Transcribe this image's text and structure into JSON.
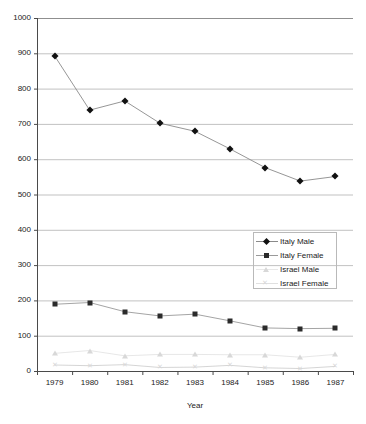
{
  "chart_data": {
    "type": "line",
    "title": "",
    "xlabel": "Year",
    "ylabel": "",
    "categories": [
      "1979",
      "1980",
      "1981",
      "1982",
      "1983",
      "1984",
      "1985",
      "1986",
      "1987"
    ],
    "x": [
      1979,
      1980,
      1981,
      1982,
      1983,
      1984,
      1985,
      1986,
      1987
    ],
    "ylim": [
      0,
      1000
    ],
    "ytick_labels": [
      "0",
      "100",
      "200",
      "300",
      "400",
      "500",
      "600",
      "700",
      "800",
      "900",
      "1000"
    ],
    "ytick_values": [
      0,
      100,
      200,
      300,
      400,
      500,
      600,
      700,
      800,
      900,
      1000
    ],
    "grid": true,
    "grid_axis": "y",
    "legend_position": "center-right",
    "series": [
      {
        "name": "Italy Male",
        "marker": "diamond",
        "color": "#111111",
        "line_color": "#8a8a8a",
        "values": [
          893,
          739,
          765,
          702,
          679,
          629,
          576,
          538,
          551
        ]
      },
      {
        "name": "Italy Female",
        "marker": "square",
        "color": "#2b2b2b",
        "line_color": "#9a9a9a",
        "values": [
          189,
          194,
          168,
          156,
          161,
          142,
          122,
          120,
          121
        ]
      },
      {
        "name": "Israel Male",
        "marker": "triangle",
        "color": "#d8d8d8",
        "line_color": "#e4e4e4",
        "values": [
          50,
          58,
          43,
          47,
          47,
          46,
          46,
          39,
          47
        ]
      },
      {
        "name": "Israel Female",
        "marker": "x",
        "color": "#d8d8d8",
        "line_color": "#d0d0d0",
        "values": [
          17,
          15,
          18,
          10,
          11,
          16,
          9,
          7,
          13
        ]
      }
    ]
  },
  "legend": {
    "items": [
      {
        "label": "Italy Male"
      },
      {
        "label": "Italy Female"
      },
      {
        "label": "Israel Male"
      },
      {
        "label": "Israel Female"
      }
    ]
  },
  "axes": {
    "x_title": "Year"
  }
}
